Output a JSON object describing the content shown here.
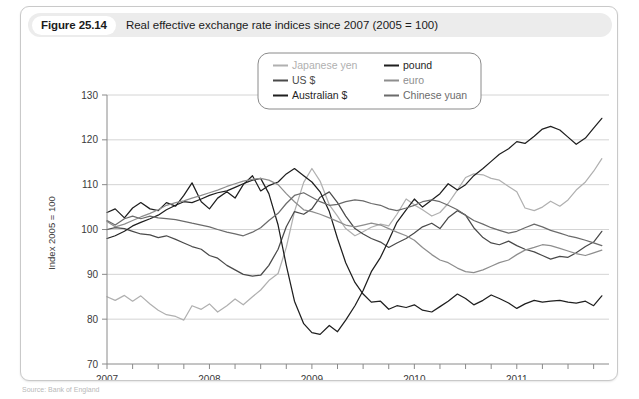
{
  "figure": {
    "number_label": "Figure 25.14",
    "title": "Real effective exchange rate indices since 2007 (2005 = 100)",
    "source_note": "Source: Bank of England"
  },
  "chart_data": {
    "type": "line",
    "title": "Real effective exchange rate indices since 2007 (2005 = 100)",
    "xlabel": "",
    "ylabel": "Index 2005 = 100",
    "ylim": [
      70,
      130
    ],
    "xlim": [
      2007.0,
      2011.9
    ],
    "yticks": [
      70,
      80,
      90,
      100,
      110,
      120,
      130
    ],
    "xticks": [
      2007,
      2008,
      2009,
      2010,
      2011
    ],
    "x_minor_step": 0.25,
    "grid": "horizontal",
    "legend_position": "top-center",
    "colors": {
      "japanese_yen": "#b0b0b0",
      "us_dollar": "#4a4a4a",
      "australian_dollar": "#1f1f1f",
      "pound": "#1f1f1f",
      "euro": "#8e8e8e",
      "chinese_yuan": "#6b6b6b"
    },
    "x": [
      2007.0,
      2007.08,
      2007.17,
      2007.25,
      2007.33,
      2007.42,
      2007.5,
      2007.58,
      2007.67,
      2007.75,
      2007.83,
      2007.92,
      2008.0,
      2008.08,
      2008.17,
      2008.25,
      2008.33,
      2008.42,
      2008.5,
      2008.58,
      2008.67,
      2008.75,
      2008.83,
      2008.92,
      2009.0,
      2009.08,
      2009.17,
      2009.25,
      2009.33,
      2009.42,
      2009.5,
      2009.58,
      2009.67,
      2009.75,
      2009.83,
      2009.92,
      2010.0,
      2010.08,
      2010.17,
      2010.25,
      2010.33,
      2010.42,
      2010.5,
      2010.58,
      2010.67,
      2010.75,
      2010.83,
      2010.92,
      2011.0,
      2011.08,
      2011.17,
      2011.25,
      2011.33,
      2011.42,
      2011.5,
      2011.58,
      2011.67,
      2011.75,
      2011.83
    ],
    "series": [
      {
        "name": "Japanese yen",
        "color": "#b0b0b0",
        "values": [
          85.0,
          84.2,
          85.3,
          84.0,
          85.2,
          83.4,
          82.0,
          81.0,
          80.6,
          79.8,
          83.0,
          82.2,
          83.4,
          81.6,
          83.0,
          84.5,
          83.2,
          85.0,
          86.5,
          88.6,
          90.2,
          96.0,
          104.0,
          110.5,
          113.6,
          110.8,
          105.5,
          103.0,
          100.2,
          98.6,
          99.5,
          100.5,
          101.2,
          100.8,
          103.4,
          106.8,
          105.5,
          104.4,
          103.0,
          103.8,
          105.8,
          108.8,
          111.6,
          112.4,
          112.2,
          111.4,
          111.0,
          109.6,
          108.4,
          104.8,
          104.2,
          105.0,
          106.3,
          105.2,
          106.6,
          108.8,
          110.6,
          113.0,
          115.8
        ]
      },
      {
        "name": "US $",
        "color": "#4a4a4a",
        "values": [
          100.0,
          100.4,
          100.2,
          99.6,
          99.0,
          98.8,
          98.2,
          98.6,
          97.8,
          97.0,
          96.2,
          95.6,
          94.2,
          93.6,
          92.0,
          91.0,
          90.0,
          89.6,
          89.8,
          92.0,
          95.6,
          100.6,
          104.0,
          103.4,
          104.6,
          107.2,
          108.4,
          106.0,
          103.0,
          100.2,
          99.0,
          98.0,
          97.2,
          96.0,
          97.0,
          98.0,
          99.2,
          100.6,
          101.4,
          100.2,
          102.6,
          104.2,
          103.2,
          100.4,
          98.2,
          97.0,
          96.6,
          97.4,
          96.4,
          95.6,
          95.0,
          94.2,
          93.4,
          94.0,
          93.8,
          94.8,
          96.2,
          97.2,
          99.6
        ]
      },
      {
        "name": "Australian $",
        "color": "#1f1f1f",
        "values": [
          98.0,
          98.6,
          99.6,
          100.8,
          101.6,
          102.4,
          103.2,
          104.4,
          105.4,
          106.2,
          106.0,
          106.8,
          107.6,
          108.2,
          108.6,
          109.4,
          110.2,
          111.0,
          111.4,
          108.0,
          101.0,
          92.0,
          84.0,
          79.0,
          77.0,
          76.6,
          78.6,
          77.2,
          79.8,
          83.0,
          86.4,
          90.6,
          93.8,
          97.6,
          101.6,
          104.4,
          106.8,
          105.0,
          106.6,
          108.0,
          110.2,
          108.8,
          110.0,
          112.0,
          113.6,
          115.2,
          116.8,
          118.0,
          119.6,
          119.2,
          120.8,
          122.4,
          123.0,
          122.2,
          120.6,
          119.0,
          120.4,
          122.6,
          124.8
        ]
      },
      {
        "name": "pound",
        "color": "#1f1f1f",
        "values": [
          103.8,
          104.6,
          102.6,
          104.8,
          106.0,
          104.6,
          104.2,
          106.0,
          105.2,
          107.6,
          110.4,
          106.2,
          104.6,
          107.0,
          108.4,
          107.0,
          110.0,
          112.0,
          108.6,
          109.8,
          110.6,
          112.4,
          113.6,
          112.0,
          110.6,
          108.4,
          104.0,
          98.0,
          92.6,
          88.2,
          85.6,
          83.8,
          84.0,
          82.2,
          83.0,
          82.6,
          83.2,
          82.0,
          81.6,
          82.8,
          84.0,
          85.6,
          84.6,
          83.2,
          84.2,
          85.4,
          84.6,
          83.6,
          82.4,
          83.4,
          84.2,
          83.8,
          84.0,
          84.2,
          83.8,
          83.6,
          84.0,
          83.0,
          85.2
        ]
      },
      {
        "name": "euro",
        "color": "#8e8e8e",
        "values": [
          101.8,
          100.6,
          101.2,
          102.0,
          102.8,
          103.6,
          104.4,
          105.4,
          106.0,
          106.4,
          107.0,
          107.6,
          108.2,
          108.8,
          109.6,
          110.2,
          110.8,
          111.2,
          111.4,
          111.0,
          110.0,
          108.0,
          106.2,
          104.4,
          104.0,
          103.4,
          102.6,
          101.8,
          101.0,
          100.6,
          101.0,
          101.4,
          101.0,
          100.2,
          99.4,
          98.6,
          97.6,
          96.0,
          94.4,
          93.2,
          92.6,
          91.4,
          90.6,
          90.4,
          91.0,
          91.8,
          92.6,
          93.2,
          94.4,
          95.4,
          96.0,
          96.6,
          96.4,
          95.8,
          95.2,
          94.6,
          94.2,
          94.8,
          95.4
        ]
      },
      {
        "name": "Chinese yuan",
        "color": "#6b6b6b",
        "values": [
          102.0,
          101.0,
          102.4,
          103.0,
          102.4,
          103.0,
          102.6,
          102.4,
          102.2,
          101.8,
          101.4,
          101.0,
          100.6,
          100.0,
          99.4,
          99.0,
          98.6,
          99.4,
          100.4,
          102.0,
          103.6,
          105.8,
          107.6,
          108.2,
          107.2,
          106.2,
          105.4,
          105.6,
          106.2,
          106.6,
          106.4,
          105.8,
          105.4,
          104.6,
          104.2,
          104.8,
          105.4,
          106.2,
          106.6,
          106.2,
          105.4,
          104.4,
          103.2,
          102.0,
          101.2,
          100.4,
          99.8,
          99.2,
          99.6,
          100.4,
          101.2,
          100.6,
          99.8,
          99.2,
          98.6,
          98.2,
          97.6,
          97.0,
          96.4
        ]
      }
    ]
  },
  "legend": {
    "entries": [
      {
        "label": "Japanese yen",
        "color": "#b0b0b0"
      },
      {
        "label": "pound",
        "color": "#1f1f1f"
      },
      {
        "label": "US $",
        "color": "#4a4a4a"
      },
      {
        "label": "euro",
        "color": "#8e8e8e"
      },
      {
        "label": "Australian $",
        "color": "#1f1f1f"
      },
      {
        "label": "Chinese yuan",
        "color": "#6b6b6b"
      }
    ]
  }
}
